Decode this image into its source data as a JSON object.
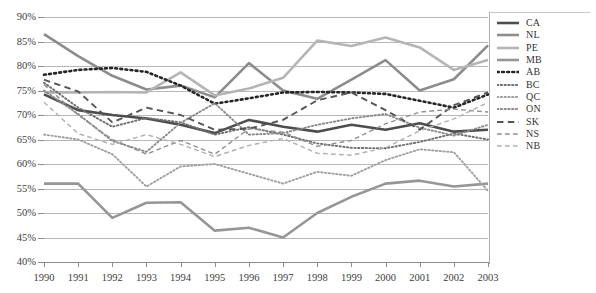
{
  "title_partial": "",
  "chart_data": {
    "type": "line",
    "title": "",
    "xlabel": "",
    "ylabel": "",
    "x": [
      1990,
      1991,
      1992,
      1993,
      1994,
      1995,
      1996,
      1997,
      1998,
      1999,
      2000,
      2001,
      2002,
      2003
    ],
    "xtick_labels": [
      "1990",
      "1991",
      "1992",
      "1993",
      "1994",
      "1995",
      "1996",
      "1997",
      "1998",
      "1999",
      "2000",
      "2001",
      "2002",
      "2003"
    ],
    "ytick_labels": [
      "90%",
      "85%",
      "80%",
      "75%",
      "70%",
      "65%",
      "60%",
      "55%",
      "50%",
      "45%",
      "40%"
    ],
    "ylim": [
      40,
      90
    ],
    "ytick_step": 5,
    "grid": true,
    "legend_position": "right",
    "series": [
      {
        "name": "CA",
        "style": "solid",
        "width": 2.6,
        "color": "#4d4d4d",
        "values": [
          74.2,
          71.0,
          70.0,
          69.3,
          68.0,
          66.3,
          69.0,
          67.6,
          66.6,
          68.0,
          67.0,
          68.3,
          66.6,
          67.0
        ]
      },
      {
        "name": "NL",
        "style": "solid",
        "width": 2.6,
        "color": "#8c8c8c",
        "values": [
          86.5,
          82.0,
          78.0,
          75.2,
          76.0,
          73.6,
          80.6,
          75.0,
          73.3,
          77.2,
          81.2,
          75.0,
          77.3,
          84.2
        ]
      },
      {
        "name": "PE",
        "style": "solid",
        "width": 2.6,
        "color": "#b5b5b5",
        "values": [
          74.6,
          74.6,
          74.7,
          74.6,
          78.7,
          74.0,
          75.4,
          77.6,
          85.2,
          84.1,
          85.8,
          83.8,
          79.2,
          81.2
        ]
      },
      {
        "name": "MB",
        "style": "solid",
        "width": 2.6,
        "color": "#969696",
        "values": [
          56.0,
          56.0,
          49.0,
          52.1,
          52.2,
          46.4,
          47.0,
          45.0,
          50.0,
          53.3,
          56.0,
          56.6,
          55.4,
          56.0
        ]
      },
      {
        "name": "AB",
        "style": "dotted",
        "width": 2.6,
        "color": "#262626",
        "values": [
          78.2,
          79.2,
          79.6,
          78.8,
          76.0,
          72.3,
          73.4,
          74.6,
          74.7,
          74.6,
          74.3,
          72.9,
          71.5,
          74.2
        ]
      },
      {
        "name": "BC",
        "style": "dotted",
        "width": 1.9,
        "color": "#6e6e6e",
        "values": [
          76.6,
          71.5,
          67.6,
          69.4,
          68.5,
          66.0,
          67.5,
          66.0,
          64.2,
          63.3,
          63.2,
          64.5,
          66.2,
          65.0
        ]
      },
      {
        "name": "QC",
        "style": "dotted",
        "width": 1.9,
        "color": "#a0a0a0",
        "values": [
          66.0,
          65.0,
          62.0,
          55.4,
          59.5,
          60.0,
          58.0,
          56.0,
          58.4,
          57.6,
          60.8,
          63.0,
          62.4,
          54.5
        ]
      },
      {
        "name": "ON",
        "style": "dotted",
        "width": 1.9,
        "color": "#8a8a8a",
        "values": [
          75.0,
          70.2,
          64.7,
          62.5,
          68.4,
          72.4,
          66.0,
          66.3,
          68.0,
          69.3,
          70.2,
          67.4,
          65.8,
          68.0
        ]
      },
      {
        "name": "SK",
        "style": "dashed",
        "width": 1.9,
        "color": "#555555",
        "values": [
          77.2,
          74.8,
          68.5,
          71.5,
          70.0,
          67.0,
          67.2,
          69.0,
          73.0,
          74.6,
          71.0,
          67.0,
          72.0,
          74.6
        ]
      },
      {
        "name": "NS",
        "style": "dashed",
        "width": 1.4,
        "color": "#8f8f8f",
        "values": [
          76.2,
          70.0,
          65.0,
          62.0,
          64.8,
          62.0,
          67.2,
          66.5,
          63.6,
          64.8,
          68.2,
          70.6,
          71.2,
          70.6
        ]
      },
      {
        "name": "NB",
        "style": "dashed",
        "width": 1.4,
        "color": "#b0b0b0",
        "values": [
          72.6,
          66.2,
          64.0,
          66.0,
          64.0,
          61.5,
          63.8,
          65.2,
          62.2,
          61.8,
          63.3,
          66.8,
          69.2,
          72.6
        ]
      }
    ]
  },
  "legend": {
    "items": [
      "CA",
      "NL",
      "PE",
      "MB",
      "AB",
      "BC",
      "QC",
      "ON",
      "SK",
      "NS",
      "NB"
    ]
  }
}
